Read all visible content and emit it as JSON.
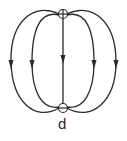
{
  "figure": {
    "label": "d",
    "stroke_color": "#2a2a2a",
    "background": "#ffffff"
  },
  "charges": [
    {
      "name": "positive-charge",
      "sign": "+",
      "cx": 63,
      "cy": 14
    },
    {
      "name": "negative-charge",
      "sign": "-",
      "cx": 63,
      "cy": 108
    }
  ],
  "field_lines": [
    {
      "name": "outer-left",
      "arrow_direction": "down"
    },
    {
      "name": "inner-left",
      "arrow_direction": "down"
    },
    {
      "name": "center",
      "arrow_direction": "down"
    },
    {
      "name": "inner-right",
      "arrow_direction": "down"
    },
    {
      "name": "outer-right",
      "arrow_direction": "down"
    }
  ]
}
